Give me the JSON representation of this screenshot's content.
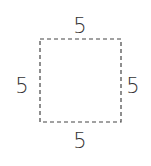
{
  "diagram": {
    "shape": "square",
    "border_style": "dashed",
    "border_color": "#444444",
    "sides": {
      "top": "5",
      "left": "5",
      "right": "5",
      "bottom": "5"
    }
  }
}
